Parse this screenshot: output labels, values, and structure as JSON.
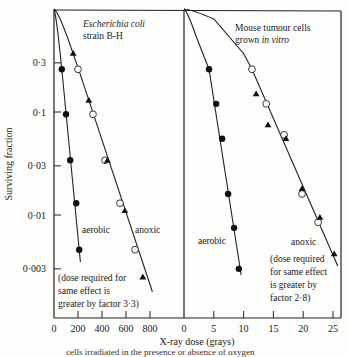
{
  "chart_data": [
    {
      "type": "scatter",
      "panel": "left",
      "title_line1": "Escherichia coli",
      "title_line2": "strain B-H",
      "xlabel": "X-ray dose (grays)",
      "ylabel": "Surviving fraction",
      "xlim": [
        0,
        900
      ],
      "ylim": [
        0.0018,
        1
      ],
      "yscale": "log",
      "xticks": [
        0,
        200,
        400,
        600,
        800
      ],
      "xtick_labels": [
        "0",
        "200",
        "400",
        "600",
        "800"
      ],
      "yticks": [
        0.3,
        0.1,
        0.03,
        0.01,
        0.003
      ],
      "ytick_labels": [
        "0·3",
        "0·1",
        "0·03",
        "0·01",
        "0·003"
      ],
      "series": [
        {
          "name": "aerobic",
          "marker": "filled-circle",
          "x": [
            65,
            100,
            135,
            185,
            210
          ],
          "y": [
            0.26,
            0.095,
            0.034,
            0.013,
            0.0046
          ]
        },
        {
          "name": "anoxic (open)",
          "marker": "open-circle",
          "x": [
            200,
            325,
            425,
            550,
            675
          ],
          "y": [
            0.26,
            0.095,
            0.034,
            0.013,
            0.0046
          ]
        },
        {
          "name": "anoxic (triangle)",
          "marker": "filled-triangle",
          "x": [
            160,
            290,
            445,
            590,
            740
          ],
          "y": [
            0.37,
            0.13,
            0.034,
            0.011,
            0.0025
          ]
        }
      ],
      "fit_lines": [
        {
          "name": "aerobic",
          "x": [
            0,
            65,
            220
          ],
          "y": [
            1,
            0.26,
            0.0035
          ]
        },
        {
          "name": "anoxic",
          "x": [
            0,
            120,
            200,
            820
          ],
          "y": [
            1,
            0.5,
            0.27,
            0.0018
          ]
        }
      ],
      "annotations": {
        "aerobic": "aerobic",
        "anoxic": "anoxic",
        "note": [
          "(dose required for",
          "same effect  is",
          "greater by factor 3·3)"
        ]
      }
    },
    {
      "type": "scatter",
      "panel": "right",
      "title_line1": "Mouse tumour cells",
      "title_line2_a": "grown ",
      "title_line2_b": "in vitro",
      "xlim": [
        0,
        26.5
      ],
      "ylim": [
        0.0018,
        1
      ],
      "yscale": "log",
      "xticks": [
        0,
        5,
        10,
        15,
        20,
        25
      ],
      "xtick_labels": [
        "0",
        "5",
        "10",
        "15",
        "20",
        "25"
      ],
      "series": [
        {
          "name": "aerobic",
          "marker": "filled-circle",
          "x": [
            4.2,
            5.4,
            6.4,
            7.4,
            8.4,
            9.2
          ],
          "y": [
            0.26,
            0.12,
            0.055,
            0.016,
            0.0075,
            0.003
          ]
        },
        {
          "name": "anoxic (open)",
          "marker": "open-circle",
          "x": [
            11.4,
            13.8,
            16.8,
            19.8,
            22.5
          ],
          "y": [
            0.26,
            0.12,
            0.06,
            0.016,
            0.0085
          ]
        },
        {
          "name": "anoxic (triangle)",
          "marker": "filled-triangle",
          "x": [
            12.1,
            14.1,
            17.1,
            19.8,
            22.8,
            25.2
          ],
          "y": [
            0.15,
            0.075,
            0.055,
            0.018,
            0.0095,
            0.0042
          ]
        }
      ],
      "fit_lines": [
        {
          "name": "aerobic",
          "x": [
            0,
            2,
            4.2,
            9.6
          ],
          "y": [
            1,
            0.55,
            0.26,
            0.0026
          ]
        },
        {
          "name": "anoxic",
          "x": [
            0,
            5,
            10,
            11.4,
            25.8
          ],
          "y": [
            1,
            0.8,
            0.37,
            0.26,
            0.0032
          ]
        }
      ],
      "annotations": {
        "aerobic": "aerobic",
        "anoxic": "anoxic",
        "note": [
          "(dose required",
          "for same effect",
          "is greater by",
          "factor 2·8)"
        ]
      }
    }
  ],
  "caption_fragment": "cells irradiated in the presence or absence of oxygen"
}
